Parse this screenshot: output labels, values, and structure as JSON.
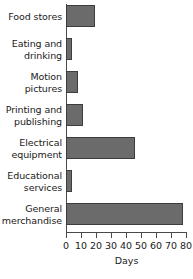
{
  "chart_data": {
    "type": "bar",
    "orientation": "horizontal",
    "title": "",
    "xlabel": "Days",
    "ylabel": "",
    "xlim": [
      0,
      80
    ],
    "xticks": [
      0,
      10,
      20,
      30,
      40,
      50,
      60,
      70,
      80
    ],
    "grid": false,
    "legend": null,
    "categories": [
      "Food stores",
      "Eating and drinking",
      "Motion pictures",
      "Printing and publishing",
      "Electrical equipment",
      "Educational services",
      "General merchandise"
    ],
    "category_lines": [
      "Food stores",
      "Eating and\ndrinking",
      "Motion\npictures",
      "Printing and\npublishing",
      "Electrical\nequipment",
      "Educational\nservices",
      "General\nmerchandise"
    ],
    "values": [
      19,
      4,
      8,
      11,
      46,
      4,
      78
    ],
    "bar_color": "#6b6b6b",
    "bar_edge_color": "#3d3d3d",
    "axis_color": "#4a4a4a",
    "background": "#ffffff"
  }
}
